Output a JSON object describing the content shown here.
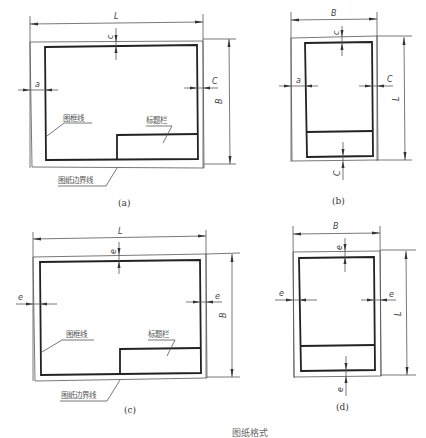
{
  "figure": {
    "caption_bottom": "图纸格式",
    "panels": [
      {
        "id": "a",
        "caption": "(a)",
        "orientation": "landscape",
        "binding": "with-binding-margin",
        "width_label": "L",
        "height_label": "B",
        "left_margin_label": "a",
        "top_margin_label": "c",
        "right_margin_label": "C",
        "frame_label": "图框线",
        "title_block_label": "标题栏",
        "boundary_label": "图纸边界线"
      },
      {
        "id": "b",
        "caption": "(b)",
        "orientation": "portrait",
        "binding": "with-binding-margin",
        "width_label": "B",
        "height_label": "L",
        "left_margin_label": "a",
        "top_margin_label": "c",
        "right_margin_label": "C",
        "bottom_margin_label": "C"
      },
      {
        "id": "c",
        "caption": "(c)",
        "orientation": "landscape",
        "binding": "no-binding-margin",
        "width_label": "L",
        "height_label": "B",
        "left_margin_label": "e",
        "top_margin_label": "e",
        "right_margin_label": "e",
        "frame_label": "图框线",
        "title_block_label": "标题栏",
        "boundary_label": "图纸边界线"
      },
      {
        "id": "d",
        "caption": "(d)",
        "orientation": "portrait",
        "binding": "no-binding-margin",
        "width_label": "B",
        "height_label": "L",
        "left_margin_label": "e",
        "top_margin_label": "e",
        "right_margin_label": "e",
        "bottom_margin_label": "e"
      }
    ]
  }
}
